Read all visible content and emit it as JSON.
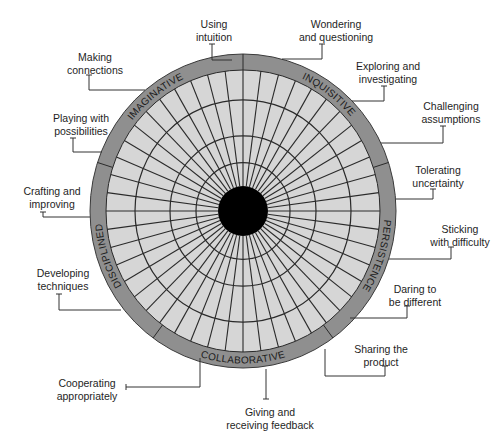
{
  "diagram": {
    "center": {
      "x": 243,
      "y": 211
    },
    "outer_radius": {
      "rx": 153,
      "ry": 157
    },
    "inner_radius": {
      "rx": 137,
      "ry": 141
    },
    "grid_rings": [
      47,
      73,
      108
    ],
    "hub_radius": 25,
    "spoke_count": 48,
    "colors": {
      "ring": "#8f8f8f",
      "grid_fill": "#d6d6d6",
      "grid_line": "#2a2a2a",
      "hub": "#000000",
      "leader": "#333333",
      "text": "#1e1e1e"
    }
  },
  "categories": [
    {
      "name": "IMAGINATIVE",
      "start_deg": 90,
      "end_deg": 162,
      "label_deg": 128
    },
    {
      "name": "INQUISITIVE",
      "start_deg": 18,
      "end_deg": 90,
      "label_deg": 53
    },
    {
      "name": "PERSISTENCE",
      "start_deg": -54,
      "end_deg": 18,
      "label_deg": -18
    },
    {
      "name": "COLLABORATIVE",
      "start_deg": -126,
      "end_deg": -54,
      "label_deg": -90
    },
    {
      "name": "DISCIPLINED",
      "start_deg": 162,
      "end_deg": 234,
      "label_deg": 198
    }
  ],
  "habits": [
    {
      "text": "Using\nintuition",
      "category": "IMAGINATIVE",
      "lx": 184,
      "ly": 18,
      "w": 60,
      "leader": [
        [
          212,
          44
        ],
        [
          212,
          60
        ],
        [
          232,
          60
        ]
      ]
    },
    {
      "text": "Making\nconnections",
      "category": "IMAGINATIVE",
      "lx": 57,
      "ly": 51,
      "w": 76,
      "leader": [
        [
          89,
          75
        ],
        [
          89,
          90
        ],
        [
          145,
          90
        ]
      ]
    },
    {
      "text": "Playing with\npossibilities",
      "category": "IMAGINATIVE",
      "lx": 42,
      "ly": 112,
      "w": 78,
      "leader": [
        [
          73,
          138
        ],
        [
          73,
          152
        ],
        [
          102,
          152
        ]
      ]
    },
    {
      "text": "Crafting and\nimproving",
      "category": "DISCIPLINED",
      "lx": 14,
      "ly": 185,
      "w": 76,
      "leader": [
        [
          43,
          212
        ],
        [
          43,
          217
        ],
        [
          90,
          217
        ]
      ]
    },
    {
      "text": "Developing\ntechniques",
      "category": "DISCIPLINED",
      "lx": 28,
      "ly": 267,
      "w": 70,
      "leader": [
        [
          59,
          294
        ],
        [
          59,
          310
        ],
        [
          121,
          310
        ]
      ]
    },
    {
      "text": "Cooperating\nappropriately",
      "category": "COLLABORATIVE",
      "lx": 47,
      "ly": 377,
      "w": 80,
      "leader": [
        [
          126,
          387
        ],
        [
          200,
          387
        ],
        [
          200,
          358
        ]
      ]
    },
    {
      "text": "Giving and\nreceiving feedback",
      "category": "COLLABORATIVE",
      "lx": 215,
      "ly": 406,
      "w": 110,
      "leader": [
        [
          266,
          399
        ],
        [
          266,
          369
        ]
      ]
    },
    {
      "text": "Sharing the\nproduct",
      "category": "COLLABORATIVE",
      "lx": 345,
      "ly": 343,
      "w": 72,
      "leader": [
        [
          385,
          366
        ],
        [
          385,
          376
        ],
        [
          325,
          376
        ],
        [
          325,
          349
        ]
      ]
    },
    {
      "text": "Daring to\nbe different",
      "category": "PERSISTENCE",
      "lx": 378,
      "ly": 283,
      "w": 74,
      "leader": [
        [
          407,
          306
        ],
        [
          407,
          318
        ],
        [
          350,
          318
        ]
      ]
    },
    {
      "text": "Sticking\nwith difficulty",
      "category": "PERSISTENCE",
      "lx": 418,
      "ly": 223,
      "w": 84,
      "leader": [
        [
          451,
          247
        ],
        [
          451,
          259
        ],
        [
          389,
          259
        ]
      ]
    },
    {
      "text": "Tolerating\nuncertainty",
      "category": "PERSISTENCE",
      "lx": 402,
      "ly": 164,
      "w": 72,
      "leader": [
        [
          433,
          189
        ],
        [
          433,
          199
        ],
        [
          396,
          199
        ]
      ]
    },
    {
      "text": "Challenging\nassumptions",
      "category": "INQUISITIVE",
      "lx": 410,
      "ly": 100,
      "w": 82,
      "leader": [
        [
          443,
          126
        ],
        [
          443,
          143
        ],
        [
          381,
          143
        ]
      ]
    },
    {
      "text": "Exploring and\ninvestigating",
      "category": "INQUISITIVE",
      "lx": 345,
      "ly": 60,
      "w": 86,
      "leader": [
        [
          384,
          86
        ],
        [
          384,
          101
        ],
        [
          352,
          101
        ]
      ]
    },
    {
      "text": "Wondering\nand questioning",
      "category": "INQUISITIVE",
      "lx": 283,
      "ly": 18,
      "w": 106,
      "leader": [
        [
          322,
          44
        ],
        [
          322,
          59
        ],
        [
          282,
          59
        ]
      ]
    }
  ]
}
